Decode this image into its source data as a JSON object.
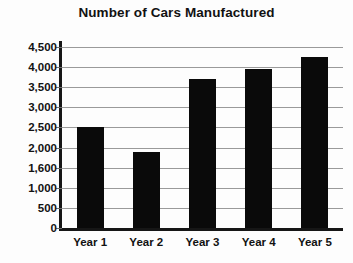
{
  "chart_data": {
    "type": "bar",
    "title": "Number of Cars Manufactured",
    "xlabel": "",
    "ylabel": "",
    "categories": [
      "Year 1",
      "Year 2",
      "Year 3",
      "Year 4",
      "Year 5"
    ],
    "values": [
      2500,
      1900,
      3700,
      3950,
      4250
    ],
    "series": [
      {
        "name": "Cars Manufactured",
        "values": [
          2500,
          1900,
          3700,
          3950,
          4250
        ]
      }
    ],
    "ylim": [
      0,
      4500
    ],
    "ytick_labels": [
      "4,500",
      "4,000",
      "3,500",
      "3,000",
      "2,500",
      "2,000",
      "1,600",
      "1,000",
      "500",
      "0"
    ],
    "ytick_values": [
      4500,
      4000,
      3500,
      3000,
      2500,
      2000,
      1600,
      1000,
      500,
      0
    ],
    "grid": true,
    "legend": false,
    "legend_position": "none",
    "bar_color": "#0a0a0a",
    "gridline_color": "#9a9a9a",
    "axis_color": "#161616",
    "background_color": "#fdfdfd",
    "text_color": "#121212"
  }
}
